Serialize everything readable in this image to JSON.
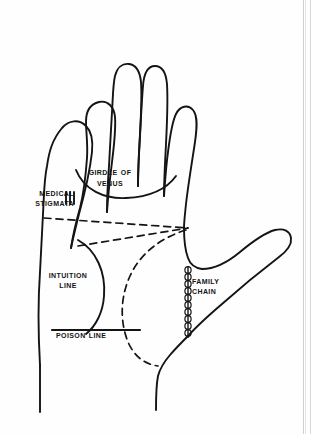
{
  "figure": {
    "kind": "palmistry-hand-diagram",
    "ink_color": "#141414",
    "background_color": "#fefefe",
    "page_edge_color": "#cfcfcf"
  },
  "labels": {
    "girdle_of_venus": "Girdle of\nVenus",
    "medical_stigmata": "Medical\nStigmata",
    "intuition_line": "Intuition\nLine",
    "poison_line": "Poison Line",
    "family_chain": "Family\nChain"
  },
  "marks": {
    "medical_stigmata_strokes": 3,
    "family_chain_style": "chain",
    "girdle_of_venus_style": "solid-arc",
    "intuition_line_style": "solid-arc",
    "poison_line_style": "solid-straight",
    "guide_lines_style": "dashed"
  }
}
